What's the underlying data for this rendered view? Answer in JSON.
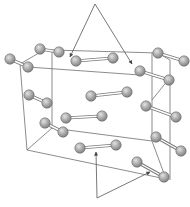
{
  "diagram": {
    "colors": {
      "background": "#ffffff",
      "edge": "#6e6e6e",
      "arrow": "#555555",
      "atom_light": "#d4d4d4",
      "atom_dark": "#8c8c8c"
    },
    "atom_radius": 5.2,
    "cell_edges": [
      [
        52,
        50,
        158,
        53
      ],
      [
        28,
        67,
        140,
        75
      ],
      [
        20,
        64,
        44,
        50
      ],
      [
        52,
        50,
        52,
        128
      ],
      [
        20,
        64,
        27,
        150
      ],
      [
        52,
        128,
        152,
        141
      ],
      [
        27,
        150,
        166,
        179
      ],
      [
        27,
        150,
        52,
        128
      ],
      [
        152,
        53,
        152,
        141
      ],
      [
        170,
        60,
        170,
        180
      ],
      [
        158,
        53,
        170,
        60
      ],
      [
        168,
        80,
        152,
        100
      ],
      [
        152,
        141,
        166,
        179
      ]
    ],
    "molecules": [
      {
        "a": [
          40,
          49
        ],
        "b": [
          59,
          52
        ]
      },
      {
        "a": [
          10,
          59
        ],
        "b": [
          28,
          67
        ]
      },
      {
        "a": [
          76,
          61
        ],
        "b": [
          113,
          58
        ]
      },
      {
        "a": [
          158,
          53
        ],
        "b": [
          184,
          61
        ]
      },
      {
        "a": [
          140,
          71
        ],
        "b": [
          169,
          80
        ]
      },
      {
        "a": [
          29,
          95
        ],
        "b": [
          47,
          103
        ]
      },
      {
        "a": [
          91,
          96
        ],
        "b": [
          127,
          92
        ]
      },
      {
        "a": [
          66,
          118
        ],
        "b": [
          102,
          116
        ]
      },
      {
        "a": [
          45,
          123
        ],
        "b": [
          63,
          132
        ]
      },
      {
        "a": [
          146,
          106
        ],
        "b": [
          176,
          117
        ]
      },
      {
        "a": [
          156,
          137
        ],
        "b": [
          181,
          151
        ]
      },
      {
        "a": [
          80,
          148
        ],
        "b": [
          116,
          145
        ]
      },
      {
        "a": [
          137,
          162
        ],
        "b": [
          164,
          177
        ]
      }
    ],
    "arrows": [
      {
        "from": [
          95,
          4
        ],
        "to": [
          70,
          57
        ]
      },
      {
        "from": [
          95,
          4
        ],
        "to": [
          132,
          64
        ]
      },
      {
        "from": [
          97,
          198
        ],
        "to": [
          96,
          152
        ]
      },
      {
        "from": [
          97,
          198
        ],
        "to": [
          150,
          172
        ]
      }
    ]
  }
}
